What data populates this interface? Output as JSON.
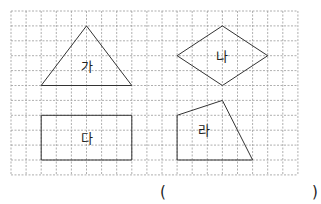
{
  "grid": {
    "columns": 19,
    "rows": 11,
    "origin_x": 11,
    "origin_y": 11,
    "cell_w": 15.1,
    "cell_h": 14.9,
    "line_color": "#9a9a9a",
    "shape_color": "#333333"
  },
  "shapes": [
    {
      "id": "ga",
      "label": "가",
      "kind": "triangle",
      "points": [
        [
          5,
          1
        ],
        [
          8,
          5
        ],
        [
          2,
          5
        ]
      ],
      "label_pos": [
        5,
        3.7
      ]
    },
    {
      "id": "na",
      "label": "나",
      "kind": "rhombus",
      "points": [
        [
          14,
          1
        ],
        [
          17,
          3
        ],
        [
          14,
          5
        ],
        [
          11,
          3
        ]
      ],
      "label_pos": [
        14,
        3
      ]
    },
    {
      "id": "da",
      "label": "다",
      "kind": "rectangle",
      "points": [
        [
          2,
          7
        ],
        [
          8,
          7
        ],
        [
          8,
          10
        ],
        [
          2,
          10
        ]
      ],
      "label_pos": [
        5,
        8.5
      ]
    },
    {
      "id": "ra",
      "label": "라",
      "kind": "quadrilateral",
      "points": [
        [
          11,
          7
        ],
        [
          14,
          6
        ],
        [
          16,
          10
        ],
        [
          11,
          10
        ]
      ],
      "label_pos": [
        12.8,
        8
      ]
    }
  ],
  "answer": {
    "open_paren": "(",
    "close_paren": ")",
    "value": ""
  }
}
